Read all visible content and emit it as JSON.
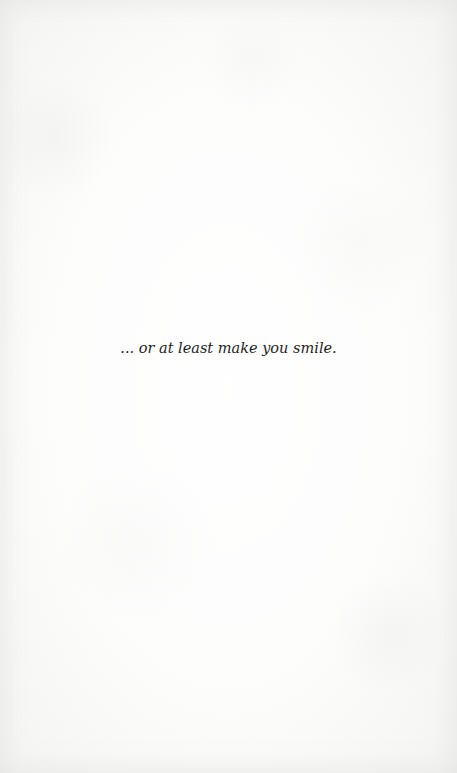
{
  "page": {
    "background_color": "#fbfbfa",
    "text_color": "#1e1e1e",
    "quote": "... or at least make you smile."
  }
}
